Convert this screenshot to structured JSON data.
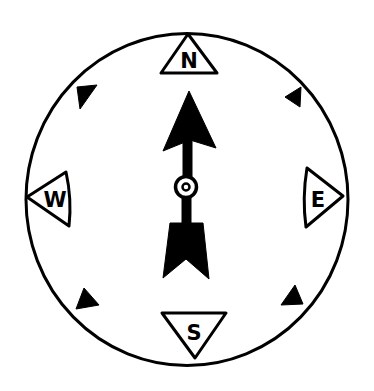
{
  "diagram": {
    "type": "compass-rose",
    "colors": {
      "ink": "#000000",
      "paper": "#ffffff"
    },
    "directions": {
      "north": {
        "label": "N"
      },
      "south": {
        "label": "S"
      },
      "east": {
        "label": "E"
      },
      "west": {
        "label": "W"
      }
    },
    "intercardinal_markers": [
      "NW",
      "NE",
      "SW",
      "SE"
    ],
    "needle": {
      "pointing": "N",
      "pivot": "ring"
    }
  }
}
